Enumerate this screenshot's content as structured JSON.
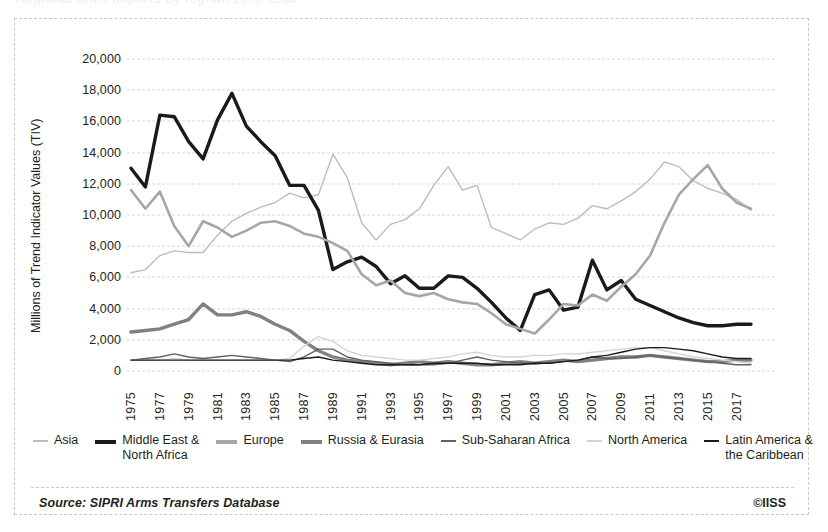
{
  "title_partial": "Regional arms imports by region, 1975-2018",
  "footer": {
    "source": "Source: SIPRI Arms Transfers Database",
    "copyright": "©IISS"
  },
  "axes": {
    "ylabel": "Millions of Trend Indicator Values (TIV)",
    "yticks": [
      "20,000",
      "18,000",
      "16,000",
      "14,000",
      "12,000",
      "10,000",
      "8,000",
      "6,000",
      "4,000",
      "2,000",
      "0"
    ],
    "xticks": [
      "1975",
      "1977",
      "1979",
      "1981",
      "1983",
      "1985",
      "1987",
      "1989",
      "1991",
      "1993",
      "1995",
      "1997",
      "1999",
      "2001",
      "2003",
      "2005",
      "2007",
      "2009",
      "2011",
      "2013",
      "2015",
      "2017"
    ]
  },
  "legend": {
    "items": [
      {
        "label": "Asia",
        "label2": "",
        "style": "thin",
        "color": "#bdbdbd"
      },
      {
        "label": "Middle East &",
        "label2": "North Africa",
        "style": "thick",
        "color": "#1a1a1a"
      },
      {
        "label": "Europe",
        "label2": "",
        "style": "thick",
        "color": "#a6a6a6"
      },
      {
        "label": "Russia & Eurasia",
        "label2": "",
        "style": "thick",
        "color": "#808080"
      },
      {
        "label": "Sub-Saharan Africa",
        "label2": "",
        "style": "thin",
        "color": "#606060"
      },
      {
        "label": "North America",
        "label2": "",
        "style": "thin",
        "color": "#d4d4d4"
      },
      {
        "label": "Latin America &",
        "label2": "the Caribbean",
        "style": "thin",
        "color": "#1a1a1a"
      }
    ]
  },
  "chart_data": {
    "type": "line",
    "title": "Regional arms imports by region, 1975-2018",
    "xlabel": "",
    "ylabel": "Millions of Trend Indicator Values (TIV)",
    "ylim": [
      0,
      20000
    ],
    "ytick_step": 2000,
    "grid": true,
    "legend_position": "bottom",
    "x": [
      1975,
      1976,
      1977,
      1978,
      1979,
      1980,
      1981,
      1982,
      1983,
      1984,
      1985,
      1986,
      1987,
      1988,
      1989,
      1990,
      1991,
      1992,
      1993,
      1994,
      1995,
      1996,
      1997,
      1998,
      1999,
      2000,
      2001,
      2002,
      2003,
      2004,
      2005,
      2006,
      2007,
      2008,
      2009,
      2010,
      2011,
      2012,
      2013,
      2014,
      2015,
      2016,
      2017,
      2018
    ],
    "series": [
      {
        "name": "Asia",
        "color": "#bdbdbd",
        "width": 1.4,
        "values": [
          6300,
          6500,
          7400,
          7700,
          7600,
          7600,
          8700,
          9600,
          10100,
          10500,
          10800,
          11400,
          11100,
          11300,
          13900,
          12400,
          9500,
          8400,
          9400,
          9700,
          10400,
          11900,
          13100,
          11600,
          11900,
          9200,
          8800,
          8400,
          9100,
          9500,
          9400,
          9800,
          10600,
          10400,
          10900,
          11500,
          12300,
          13400,
          13100,
          12200,
          11700,
          11400,
          11000,
          10300
        ]
      },
      {
        "name": "Middle East & North Africa",
        "color": "#1a1a1a",
        "width": 3.4,
        "values": [
          13000,
          11800,
          16400,
          16300,
          14700,
          13600,
          16100,
          17800,
          15700,
          14700,
          13800,
          11900,
          11900,
          10300,
          6500,
          7000,
          7300,
          6700,
          5600,
          6100,
          5300,
          5300,
          6100,
          6000,
          5300,
          4400,
          3400,
          2600,
          4900,
          5200,
          3900,
          4100,
          7100,
          5200,
          5800,
          4600,
          4200,
          3800,
          3400,
          3100,
          2900,
          2900,
          3000,
          3000
        ]
      },
      {
        "name": "Europe",
        "color": "#a6a6a6",
        "width": 2.6,
        "values": [
          11600,
          10400,
          11500,
          9300,
          8000,
          9600,
          9200,
          8600,
          9000,
          9500,
          9600,
          9300,
          8800,
          8600,
          8200,
          7700,
          6200,
          5500,
          5800,
          5000,
          4800,
          5000,
          4600,
          4400,
          4300,
          3700,
          3000,
          2700,
          2400,
          3300,
          4300,
          4200,
          4900,
          4500,
          5400,
          6200,
          7400,
          9500,
          11300,
          12300,
          13200,
          11700,
          10800,
          10400
        ]
      },
      {
        "name": "Russia & Eurasia",
        "color": "#808080",
        "width": 3.4,
        "values": [
          2500,
          2600,
          2700,
          3000,
          3300,
          4300,
          3600,
          3600,
          3800,
          3500,
          3000,
          2600,
          1900,
          1300,
          900,
          700,
          600,
          500,
          400,
          500,
          600,
          500,
          600,
          500,
          400,
          400,
          500,
          600,
          500,
          600,
          700,
          600,
          700,
          800,
          900,
          900,
          1000,
          900,
          800,
          700,
          600,
          600,
          700,
          700
        ]
      },
      {
        "name": "Sub-Saharan Africa",
        "color": "#606060",
        "width": 1.4,
        "values": [
          700,
          800,
          900,
          1100,
          900,
          800,
          900,
          1000,
          900,
          800,
          700,
          600,
          900,
          1400,
          1400,
          900,
          700,
          600,
          500,
          400,
          400,
          400,
          500,
          700,
          900,
          700,
          600,
          500,
          500,
          500,
          600,
          700,
          900,
          800,
          800,
          900,
          1000,
          900,
          800,
          700,
          600,
          500,
          400,
          400
        ]
      },
      {
        "name": "North America",
        "color": "#d4d4d4",
        "width": 1.4,
        "values": [
          700,
          700,
          700,
          800,
          700,
          700,
          700,
          700,
          700,
          700,
          700,
          800,
          1600,
          2200,
          1900,
          1300,
          1000,
          900,
          800,
          700,
          700,
          800,
          900,
          1100,
          1200,
          1000,
          900,
          900,
          1000,
          1000,
          1100,
          1100,
          1200,
          1300,
          1400,
          1500,
          1500,
          1300,
          1100,
          900,
          800,
          700,
          600,
          500
        ]
      },
      {
        "name": "Latin America & the Caribbean",
        "color": "#1a1a1a",
        "width": 1.4,
        "values": [
          700,
          700,
          700,
          700,
          700,
          700,
          700,
          700,
          700,
          700,
          700,
          700,
          800,
          900,
          700,
          600,
          500,
          400,
          400,
          400,
          400,
          500,
          500,
          500,
          500,
          400,
          400,
          400,
          500,
          500,
          600,
          700,
          900,
          1000,
          1200,
          1400,
          1500,
          1500,
          1400,
          1300,
          1100,
          900,
          800,
          800
        ]
      }
    ]
  }
}
